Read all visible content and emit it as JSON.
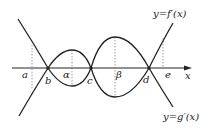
{
  "diagram": {
    "axis_label": "x",
    "curve_labels": {
      "f": "y=f′(x)",
      "g": "y=g′(x)"
    },
    "points": {
      "a": "a",
      "b": "b",
      "alpha": "α",
      "c": "c",
      "beta": "β",
      "d": "d",
      "e": "e"
    },
    "colors": {
      "curve": "#222222",
      "dashed": "#888888"
    }
  }
}
